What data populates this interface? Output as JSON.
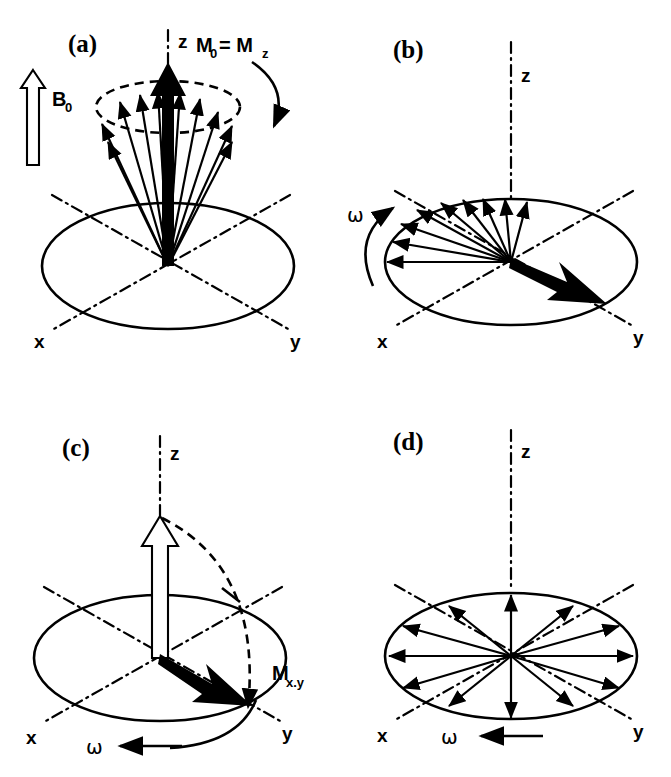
{
  "figure": {
    "background_color": "#ffffff",
    "ink_color": "#000000"
  },
  "panels": [
    {
      "id": "a",
      "letter": "(a)",
      "axes": {
        "z": "z",
        "x": "x",
        "y": "y"
      },
      "labels": {
        "field": "B",
        "field_sub": "0",
        "magnetization": "M",
        "magnetization_sub": "0",
        "magnetization_eq": "= M",
        "magnetization_eq_sub": "z"
      },
      "description": "Equilibrium: net magnetization M0 = Mz aligned along z in field B0, spins precessing on a cone",
      "spin_vector_count": 9,
      "has_precession_cone": true,
      "has_curved_precession_arrow": true,
      "has_hollow_field_arrow": true,
      "has_bold_z_arrow": true
    },
    {
      "id": "b",
      "letter": "(b)",
      "axes": {
        "z": "z",
        "x": "x",
        "y": "y"
      },
      "labels": {
        "omega": "ω"
      },
      "description": "Transverse magnetization in xy-plane beginning to dephase; fan of vectors, net vector toward +y",
      "spin_vector_count": 9,
      "has_curved_omega_arrow": true,
      "has_bold_transverse_arrow": true
    },
    {
      "id": "c",
      "letter": "(c)",
      "axes": {
        "z": "z",
        "x": "x",
        "y": "y"
      },
      "labels": {
        "omega": "ω",
        "magnetization": "M",
        "magnetization_sub": "x.y"
      },
      "description": "90 degree flip: hollow z-arrow tipped by dashed arc into transverse plane giving Mx,y",
      "has_hollow_z_arrow": true,
      "has_dashed_flip_arc": true,
      "has_bold_transverse_arrow": true,
      "has_straight_omega_arrow": true
    },
    {
      "id": "d",
      "letter": "(d)",
      "axes": {
        "z": "z",
        "x": "x",
        "y": "y"
      },
      "labels": {
        "omega": "ω"
      },
      "description": "Complete dephasing: vectors radiate uniformly in all directions in the xy-plane, zero net magnetization",
      "spin_vector_count": 12,
      "has_straight_omega_arrow": true
    }
  ]
}
